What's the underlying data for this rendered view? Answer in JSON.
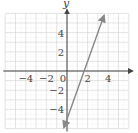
{
  "chart_data": {
    "type": "line",
    "title": "",
    "xlabel": "x",
    "ylabel": "y",
    "xlim": [
      -6,
      6
    ],
    "ylim": [
      -6,
      6
    ],
    "grid": true,
    "minor_grid": true,
    "x_ticks": [
      -4,
      -2,
      0,
      2,
      4
    ],
    "y_ticks": [
      4,
      2,
      -2,
      -4
    ],
    "x_tick_labels": [
      "−4",
      "−2",
      "0",
      "2",
      "4"
    ],
    "y_tick_labels": [
      "4",
      "2",
      "−2",
      "−4"
    ],
    "series": [
      {
        "name": "line",
        "equation": "y = 3x - 5",
        "x": [
          -0.3,
          3.6
        ],
        "y": [
          -5.9,
          5.8
        ],
        "arrows": "both",
        "color": "#888888"
      }
    ],
    "legend": null
  },
  "colors": {
    "grid": "#d9d9d9",
    "axis": "#444444",
    "line": "#888888"
  }
}
